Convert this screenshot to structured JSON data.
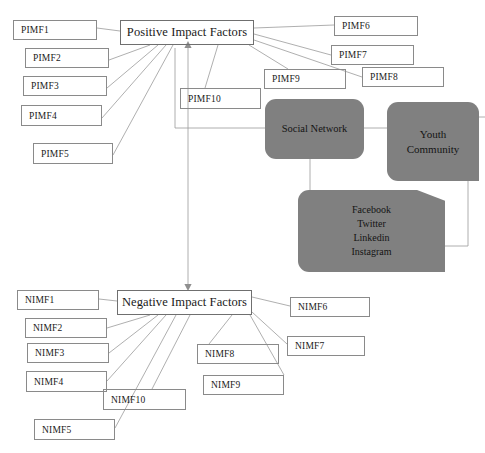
{
  "diagram": {
    "hubs": [
      {
        "id": "positive",
        "label": "Positive Impact Factors",
        "x": 120,
        "y": 20,
        "w": 134,
        "h": 25
      },
      {
        "id": "negative",
        "label": "Negative Impact Factors",
        "x": 117,
        "y": 290,
        "w": 135,
        "h": 25
      }
    ],
    "positive_factors": [
      {
        "label": "PIMF1",
        "x": 13,
        "y": 20,
        "w": 84,
        "h": 20
      },
      {
        "label": "PIMF2",
        "x": 25,
        "y": 48,
        "w": 84,
        "h": 20
      },
      {
        "label": "PIMF3",
        "x": 23,
        "y": 76,
        "w": 84,
        "h": 20
      },
      {
        "label": "PIMF4",
        "x": 21,
        "y": 105,
        "w": 81,
        "h": 21
      },
      {
        "label": "PIMF5",
        "x": 33,
        "y": 143,
        "w": 80,
        "h": 21
      },
      {
        "label": "PIMF6",
        "x": 334,
        "y": 16,
        "w": 84,
        "h": 20
      },
      {
        "label": "PIMF7",
        "x": 331,
        "y": 45,
        "w": 83,
        "h": 20
      },
      {
        "label": "PIMF8",
        "x": 362,
        "y": 67,
        "w": 82,
        "h": 20
      },
      {
        "label": "PIMF9",
        "x": 264,
        "y": 69,
        "w": 82,
        "h": 20
      },
      {
        "label": "PIMF10",
        "x": 180,
        "y": 88,
        "w": 81,
        "h": 21
      }
    ],
    "negative_factors": [
      {
        "label": "NIMF1",
        "x": 17,
        "y": 290,
        "w": 82,
        "h": 20
      },
      {
        "label": "NIMF2",
        "x": 25,
        "y": 318,
        "w": 82,
        "h": 20
      },
      {
        "label": "NIMF3",
        "x": 27,
        "y": 343,
        "w": 82,
        "h": 20
      },
      {
        "label": "NIMF4",
        "x": 26,
        "y": 371,
        "w": 81,
        "h": 21
      },
      {
        "label": "NIMF5",
        "x": 34,
        "y": 419,
        "w": 81,
        "h": 21
      },
      {
        "label": "NIMF6",
        "x": 290,
        "y": 297,
        "w": 80,
        "h": 20
      },
      {
        "label": "NIMF7",
        "x": 287,
        "y": 336,
        "w": 78,
        "h": 20
      },
      {
        "label": "NIMF8",
        "x": 197,
        "y": 344,
        "w": 82,
        "h": 20
      },
      {
        "label": "NIMF9",
        "x": 203,
        "y": 375,
        "w": 81,
        "h": 20
      },
      {
        "label": "NIMF10",
        "x": 103,
        "y": 389,
        "w": 83,
        "h": 21
      }
    ],
    "entities": [
      {
        "id": "social-network",
        "label": "Social Network",
        "x": 265,
        "y": 99,
        "w": 99,
        "h": 60
      },
      {
        "id": "youth-community",
        "label": "Youth\nCommunity",
        "x": 387,
        "y": 102,
        "w": 92,
        "h": 79
      },
      {
        "id": "platform-list",
        "label": "Facebook\nTwitter\nLinkedin\nInstagram",
        "x": 298,
        "y": 190,
        "w": 147,
        "h": 82
      }
    ],
    "platforms": [
      "Facebook",
      "Twitter",
      "Linkedin",
      "Instagram"
    ],
    "colors": {
      "entity_fill": "#808080",
      "box_stroke": "#8a8a8a",
      "hub_stroke": "#6f6f6f",
      "edge_stroke": "#9a9a9a",
      "text": "#1a1a1a",
      "background": "#ffffff"
    },
    "edges": [
      {
        "from": "PIMF1",
        "to": "positive",
        "d": "M 97 28 L 120 31"
      },
      {
        "from": "PIMF2",
        "to": "positive",
        "d": "M 109 60 L 150 45"
      },
      {
        "from": "PIMF3",
        "to": "positive",
        "d": "M 107 88 L 158 45"
      },
      {
        "from": "PIMF4",
        "to": "positive",
        "d": "M 102 118 L 166 45"
      },
      {
        "from": "PIMF5",
        "to": "positive",
        "d": "M 113 155 L 173 45"
      },
      {
        "from": "PIMF6",
        "to": "positive",
        "d": "M 254 28 L 334 25"
      },
      {
        "from": "PIMF7",
        "to": "positive",
        "d": "M 254 34 L 331 55"
      },
      {
        "from": "PIMF8",
        "to": "positive",
        "d": "M 254 40 L 362 77"
      },
      {
        "from": "PIMF9",
        "to": "positive",
        "d": "M 249 45 L 288 69"
      },
      {
        "from": "PIMF10",
        "to": "positive",
        "d": "M 205 88 L 218 45"
      },
      {
        "from": "NIMF1",
        "to": "negative",
        "d": "M 99 299 L 117 301"
      },
      {
        "from": "NIMF2",
        "to": "negative",
        "d": "M 107 328 L 150 315"
      },
      {
        "from": "NIMF3",
        "to": "negative",
        "d": "M 109 353 L 158 315"
      },
      {
        "from": "NIMF4",
        "to": "negative",
        "d": "M 107 381 L 166 315"
      },
      {
        "from": "NIMF5",
        "to": "negative",
        "d": "M 115 428 L 176 315"
      },
      {
        "from": "NIMF6",
        "to": "negative",
        "d": "M 252 297 L 290 306"
      },
      {
        "from": "NIMF7",
        "to": "negative",
        "d": "M 252 312 L 287 344"
      },
      {
        "from": "NIMF8",
        "to": "negative",
        "d": "M 232 315 L 209 344"
      },
      {
        "from": "NIMF9",
        "to": "negative",
        "d": "M 250 315 L 284 375"
      },
      {
        "from": "NIMF10",
        "to": "negative",
        "d": "M 190 315 L 152 389"
      },
      {
        "from": "social-network",
        "to": "positive",
        "d": "M 265 128 L 175 128 L 175 48"
      },
      {
        "from": "social-network",
        "to": "youth-community",
        "d": "M 364 128 L 387 128"
      },
      {
        "from": "social-network",
        "to": "platform-list",
        "d": "M 310 159 L 310 190"
      },
      {
        "from": "youth-community",
        "to": "platform-list",
        "d": "M 468 181 L 468 246 L 445 246"
      },
      {
        "from": "youth-community",
        "to": "right-edge",
        "d": "M 479 117 L 485 117"
      },
      {
        "from": "positive",
        "to": "negative",
        "d": "M 188 45 L 188 287"
      }
    ],
    "arrowheads": [
      {
        "x": 188,
        "y": 45,
        "dir": "up",
        "target": "positive"
      },
      {
        "x": 188,
        "y": 287,
        "dir": "down",
        "target": "negative"
      }
    ]
  }
}
